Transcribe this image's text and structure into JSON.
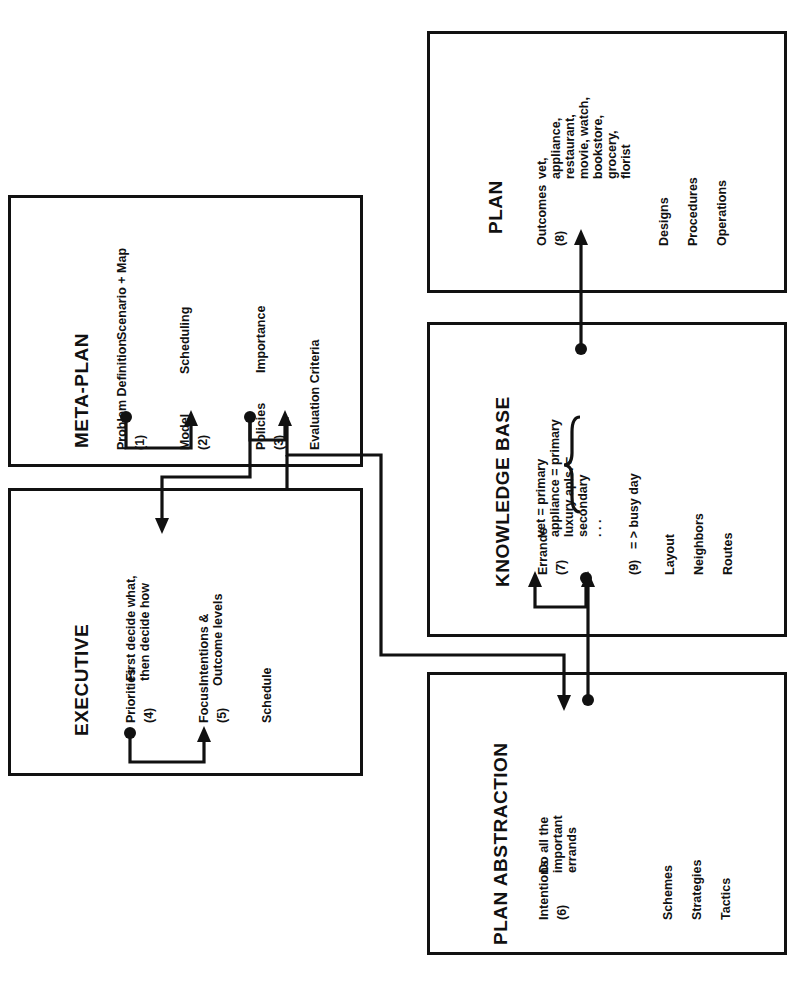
{
  "diagram": {
    "orientation": "rotated-90"
  },
  "boxes": {
    "metaplan": {
      "title": "META-PLAN",
      "fields": [
        {
          "label": "Problem Definition",
          "num": "(1)",
          "value": "Scenario + Map"
        },
        {
          "label": "Model",
          "num": "(2)",
          "value": "Scheduling"
        },
        {
          "label": "Policies",
          "num": "(3)",
          "value": "Importance"
        }
      ],
      "footer": [
        "Evaluation Criteria"
      ]
    },
    "executive": {
      "title": "EXECUTIVE",
      "fields": [
        {
          "label": "Priorities",
          "num": "(4)",
          "value": "First decide what,\nthen decide how"
        },
        {
          "label": "Focus",
          "num": "(5)",
          "value": "Intentions &\nOutcome levels"
        }
      ],
      "footer": [
        "Schedule"
      ]
    },
    "plan": {
      "title": "PLAN",
      "fields": [
        {
          "label": "Outcomes",
          "num": "(8)",
          "value": "vet,\nappliance,\nrestaurant,\nmovie, watch,\nbookstore,\ngrocery,\nflorist"
        }
      ],
      "footer": [
        "Designs",
        "Procedures",
        "Operations"
      ]
    },
    "knowledgebase": {
      "title": "KNOWLEDGE BASE",
      "fields": [
        {
          "label": "Errands",
          "num": "(7)",
          "value": "vet = primary\nappliance = primary\nluxury apls. =\nsecondary\n. . ."
        },
        {
          "label": "",
          "num": "(9)",
          "value": "= > busy day"
        }
      ],
      "footer": [
        "Layout",
        "Neighbors",
        "Routes"
      ]
    },
    "planabstraction": {
      "title": "PLAN ABSTRACTION",
      "fields": [
        {
          "label": "Intentions",
          "num": "(6)",
          "value": "Do all the\nimportant\nerrands"
        }
      ],
      "footer": [
        "Schemes",
        "Strategies",
        "Tactics"
      ]
    }
  },
  "colors": {
    "ink": "#111111",
    "paper": "#ffffff"
  }
}
